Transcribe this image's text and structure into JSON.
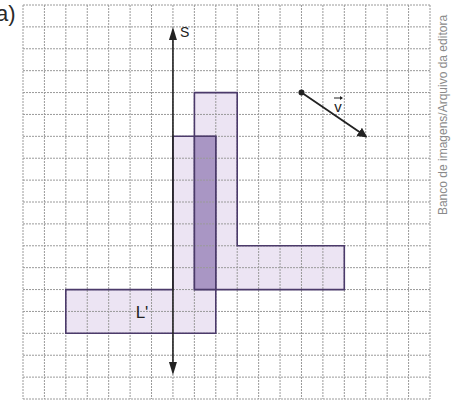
{
  "figure": {
    "part_label": "a)",
    "credit": "Banco de imagens/Arquivo da editora"
  },
  "grid": {
    "x0": 23,
    "y0": 5,
    "x1": 430,
    "y1": 399,
    "cols": 19,
    "rows": 18,
    "line_color": "#9a9a9a"
  },
  "axis": {
    "label": "S",
    "col": 7,
    "top_y": 27,
    "bottom_y": 375,
    "color": "#222222"
  },
  "shapes": {
    "L": {
      "name": "L",
      "polygon": [
        [
          8,
          4
        ],
        [
          10,
          4
        ],
        [
          10,
          11
        ],
        [
          15,
          11
        ],
        [
          15,
          13
        ],
        [
          8,
          13
        ]
      ],
      "fill": "#ece4f3",
      "stroke": "#4b3a6a"
    },
    "L_prime": {
      "name": "L'",
      "label": "L'",
      "label_pos": [
        142,
        312
      ],
      "polygon": [
        [
          7,
          6
        ],
        [
          9,
          6
        ],
        [
          9,
          15
        ],
        [
          2,
          15
        ],
        [
          2,
          13
        ],
        [
          7,
          13
        ]
      ],
      "fill": "#ece4f3",
      "stroke": "#4b3a6a"
    },
    "overlap": {
      "rect": [
        8,
        6,
        9,
        13
      ],
      "fill": "#a996c4"
    }
  },
  "vector": {
    "label": "v",
    "start": [
      13,
      4
    ],
    "end": [
      16,
      6
    ],
    "label_pos": [
      338,
      106
    ],
    "color": "#222222"
  }
}
